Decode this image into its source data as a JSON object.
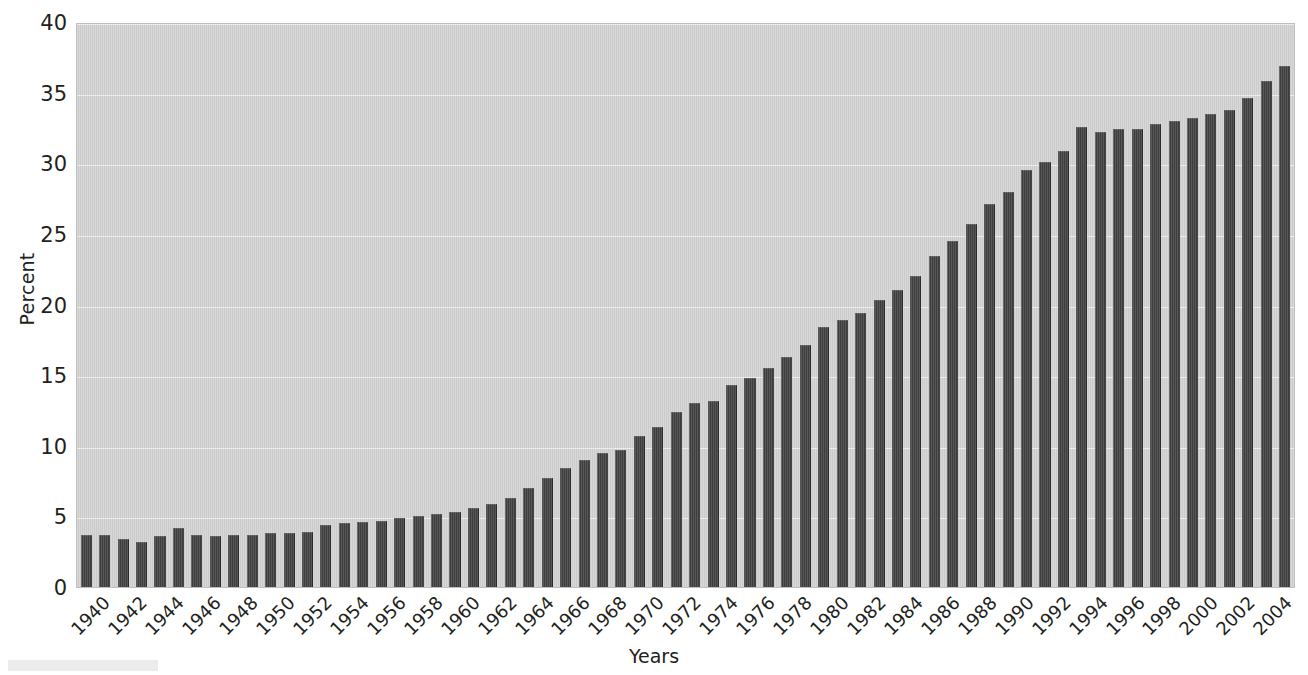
{
  "chart_data": {
    "type": "bar",
    "title": "",
    "xlabel": "Years",
    "ylabel": "Percent",
    "ylim": [
      0,
      40
    ],
    "ytick_values": [
      0,
      5,
      10,
      15,
      20,
      25,
      30,
      35,
      40
    ],
    "ytick_labels": [
      "0",
      "5",
      "10",
      "15",
      "20",
      "25",
      "30",
      "35",
      "40"
    ],
    "grid": true,
    "legend": "none",
    "xtick_labels": [
      "1940",
      "1942",
      "1944",
      "1946",
      "1948",
      "1950",
      "1952",
      "1954",
      "1956",
      "1958",
      "1960",
      "1962",
      "1964",
      "1966",
      "1968",
      "1970",
      "1972",
      "1974",
      "1976",
      "1978",
      "1980",
      "1982",
      "1984",
      "1986",
      "1988",
      "1990",
      "1992",
      "1994",
      "1996",
      "1998",
      "2000",
      "2002",
      "2004"
    ],
    "xtick_step": 2,
    "categories": [
      "1940",
      "1941",
      "1942",
      "1943",
      "1944",
      "1945",
      "1946",
      "1947",
      "1948",
      "1949",
      "1950",
      "1951",
      "1952",
      "1953",
      "1954",
      "1955",
      "1956",
      "1957",
      "1958",
      "1959",
      "1960",
      "1961",
      "1962",
      "1963",
      "1964",
      "1965",
      "1966",
      "1967",
      "1968",
      "1969",
      "1970",
      "1971",
      "1972",
      "1973",
      "1974",
      "1975",
      "1976",
      "1977",
      "1978",
      "1979",
      "1980",
      "1981",
      "1982",
      "1983",
      "1984",
      "1985",
      "1986",
      "1987",
      "1988",
      "1989",
      "1990",
      "1991",
      "1992",
      "1993",
      "1994",
      "1995",
      "1996",
      "1997",
      "1998",
      "1999",
      "2000",
      "2001",
      "2002",
      "2003",
      "2004",
      "2005"
    ],
    "values": [
      3.7,
      3.7,
      3.4,
      3.2,
      3.6,
      4.2,
      3.7,
      3.6,
      3.7,
      3.7,
      3.8,
      3.8,
      3.9,
      4.4,
      4.5,
      4.6,
      4.7,
      4.9,
      5.0,
      5.2,
      5.3,
      5.6,
      5.9,
      6.3,
      7.0,
      7.7,
      8.4,
      9.0,
      9.5,
      9.7,
      10.7,
      11.3,
      12.4,
      13.0,
      13.2,
      14.3,
      14.8,
      15.5,
      16.3,
      17.1,
      18.4,
      18.9,
      19.4,
      20.3,
      21.0,
      22.0,
      23.4,
      24.5,
      25.7,
      27.1,
      28.0,
      29.5,
      30.1,
      30.9,
      32.6,
      32.2,
      32.4,
      32.4,
      32.8,
      33.0,
      33.2,
      33.5,
      33.8,
      34.6,
      35.8,
      36.9
    ],
    "bar_color": "#3f3f3f",
    "plot_background": "#d2d2d2",
    "gridline_color": "#efefef",
    "text_color": "#231f20"
  }
}
